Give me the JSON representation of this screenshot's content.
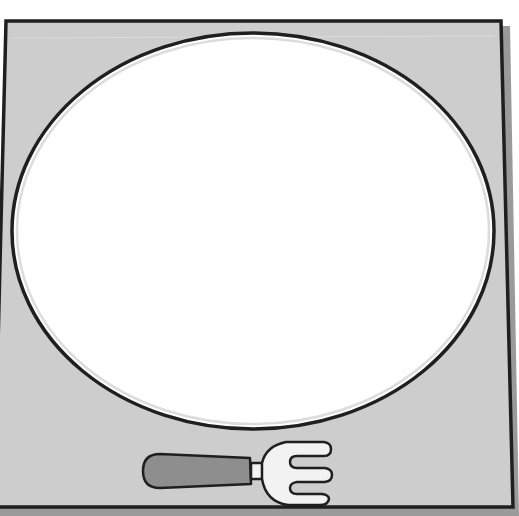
{
  "illustration": {
    "title": "Placemat with empty plate and fork",
    "placemat": {
      "fill": "#cdcdcd",
      "border": "#1f1f1f",
      "shadow": "#9a9a9a"
    },
    "plate": {
      "fill": "#ffffff",
      "rim": "#1f1f1f",
      "inner_ring": "#dcdcdc",
      "state": "empty"
    },
    "fork": {
      "handle_fill": "#8e8e8e",
      "head_fill": "#f2f2f2",
      "outline": "#1f1f1f",
      "tines": 3
    }
  }
}
